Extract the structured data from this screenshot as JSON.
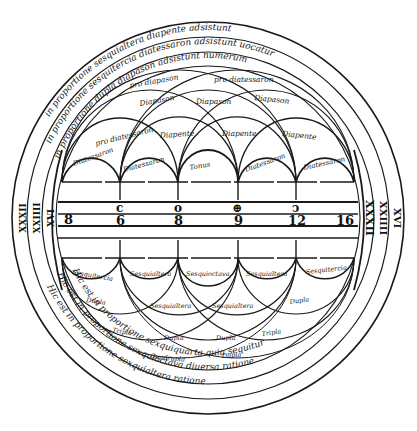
{
  "diagram": {
    "type": "medieval-harmonic-circle",
    "background": "#ffffff",
    "ink": "#1a1a1a",
    "center": [
      208,
      218
    ],
    "numbers": {
      "upper_row": [
        "c",
        "o",
        "⊕",
        "ↄ"
      ],
      "lower_row": [
        "6",
        "8",
        "9",
        "12",
        "16"
      ],
      "left_end": "8"
    },
    "small_arcs": [
      {
        "label": "Diatessaron"
      },
      {
        "label": "Diatessaron"
      },
      {
        "label": "Tonus"
      },
      {
        "label": "Diatessaron"
      },
      {
        "label": "Diatessaron"
      }
    ],
    "mid_arcs": [
      {
        "label": "Diapente"
      },
      {
        "label": "Diapente"
      },
      {
        "label": "Diapente"
      }
    ],
    "upper_arcs": [
      {
        "label": "pro diatessaron"
      },
      {
        "label": "Diapason"
      },
      {
        "label": "Diapason"
      },
      {
        "label": "Diapason"
      }
    ],
    "top_arcs": [
      {
        "label": "pro diapason"
      },
      {
        "label": "pro diatessaron"
      }
    ],
    "lower_labels": {
      "row1": [
        "Sesquitercia",
        "Sesquialtera",
        "Sesquioctava",
        "Sesquialtera",
        "Sesquitercia"
      ],
      "row2": [
        "Dupla",
        "Sesquialtera",
        "Sesquialtera",
        "Dupla"
      ],
      "row3": [
        "Tripla",
        "Dupla",
        "Dupla",
        "Tripla"
      ],
      "row4": [
        "Quadrupla",
        "Dupla"
      ]
    },
    "outer_rings": {
      "top": [
        "in proportione sesquialtera diapente adsistunt",
        "in proportione sesquitercia diatessaron adsistunt uocatur",
        "in proportione dupla diapason adsistunt numerum"
      ],
      "bottom": [
        "Hic est in proportione sexquiquarta quia sequitur",
        "Hic est in proportione sexquioctava diuersa ratione",
        "Hic est in proportione sexquialtera ratione"
      ]
    },
    "roman_left": [
      "XXXII",
      "XXIIII",
      "XVI"
    ],
    "roman_right": [
      "XXXII",
      "XXIIII",
      "XVI"
    ]
  }
}
